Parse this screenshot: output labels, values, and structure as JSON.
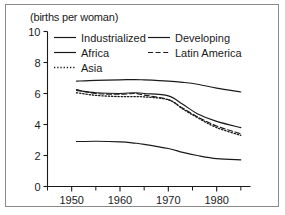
{
  "chart_data": {
    "type": "line",
    "title": "(births per woman)",
    "xlabel": "",
    "ylabel": "(births per woman)",
    "xlim": [
      1945,
      1987
    ],
    "ylim": [
      0,
      10
    ],
    "ytick_values": [
      0,
      2,
      4,
      6,
      8,
      10
    ],
    "ytick_labels": [
      "0",
      "2",
      "4",
      "6",
      "8",
      "10"
    ],
    "xtick_values": [
      1950,
      1960,
      1970,
      1980
    ],
    "xtick_labels": [
      "1950",
      "1960",
      "1970",
      "1980"
    ],
    "xminor_values": [
      1945,
      1955,
      1965,
      1975,
      1985
    ],
    "grid": false,
    "legend_position": "top-inside",
    "x": [
      1951,
      1955,
      1960,
      1963,
      1965,
      1970,
      1973,
      1976,
      1980,
      1985
    ],
    "series": [
      {
        "name": "Africa",
        "style": "solid",
        "color": "#1a1a1a",
        "values": [
          6.8,
          6.85,
          6.88,
          6.9,
          6.88,
          6.8,
          6.72,
          6.6,
          6.35,
          6.1
        ]
      },
      {
        "name": "Developing",
        "style": "solid",
        "color": "#1a1a1a",
        "values": [
          6.2,
          6.05,
          6.0,
          6.05,
          6.0,
          5.85,
          5.3,
          4.7,
          4.2,
          3.8
        ]
      },
      {
        "name": "Latin America",
        "style": "dashed",
        "color": "#1a1a1a",
        "values": [
          6.25,
          6.0,
          5.95,
          6.0,
          5.9,
          5.6,
          5.05,
          4.5,
          3.9,
          3.4
        ]
      },
      {
        "name": "Asia",
        "style": "dotted",
        "color": "#1a1a1a",
        "values": [
          6.05,
          5.88,
          5.8,
          5.8,
          5.78,
          5.6,
          5.0,
          4.45,
          3.8,
          3.3
        ]
      },
      {
        "name": "Industrialized",
        "style": "solid",
        "color": "#1a1a1a",
        "values": [
          2.9,
          2.92,
          2.88,
          2.8,
          2.72,
          2.45,
          2.2,
          2.0,
          1.8,
          1.72
        ]
      }
    ]
  },
  "legend": {
    "entries": [
      {
        "label": "Industrialized",
        "style": "solid",
        "col": 0,
        "row": 0
      },
      {
        "label": "Developing",
        "style": "solid",
        "col": 1,
        "row": 0
      },
      {
        "label": "Africa",
        "style": "solid",
        "col": 0,
        "row": 1
      },
      {
        "label": "Latin America",
        "style": "dashed",
        "col": 1,
        "row": 1
      },
      {
        "label": "Asia",
        "style": "dotted",
        "col": 0,
        "row": 2
      }
    ]
  },
  "axis": {
    "line_color": "#1a1a1a",
    "frame_color": "#8a8a8a"
  }
}
